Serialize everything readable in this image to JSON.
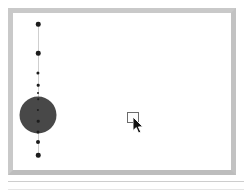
{
  "app": {
    "title": "Drawing Canvas",
    "window_style": "beveled-gray-frame"
  },
  "colors": {
    "frame": "#c9c9c9",
    "frame_shadow": "#bdbdbd",
    "canvas_background": "#ffffff",
    "spine_line": "#cfcfcf",
    "node_fill": "#1c1c1c",
    "blob_fill": "#484848",
    "cursor_outline": "#6b6b6b",
    "footer_rule": "#cecece"
  },
  "canvas": {
    "label": "drawing-canvas",
    "width": 218,
    "height": 157,
    "spine": {
      "label": "vertical-guide-line",
      "x": 25,
      "y_top": 10,
      "y_bottom": 142,
      "color": "#cfcfcf"
    },
    "nodes": [
      {
        "label": "node-1",
        "x": 25,
        "y": 11,
        "size": 4.5
      },
      {
        "label": "node-2",
        "x": 25,
        "y": 40,
        "size": 4.5
      },
      {
        "label": "node-3",
        "x": 25,
        "y": 60,
        "size": 3.2
      },
      {
        "label": "node-4",
        "x": 25,
        "y": 72,
        "size": 2.6
      },
      {
        "label": "node-5",
        "x": 25,
        "y": 80,
        "size": 2.0
      },
      {
        "label": "node-6",
        "x": 25,
        "y": 86,
        "size": 1.6
      },
      {
        "label": "node-7",
        "x": 25,
        "y": 97,
        "size": 2.2
      },
      {
        "label": "node-8",
        "x": 25,
        "y": 108,
        "size": 2.6
      },
      {
        "label": "node-9",
        "x": 25,
        "y": 119,
        "size": 3.0
      },
      {
        "label": "node-10",
        "x": 25,
        "y": 129,
        "size": 4.0
      },
      {
        "label": "node-11",
        "x": 25,
        "y": 142,
        "size": 4.5
      }
    ],
    "blob": {
      "label": "large-filled-circle",
      "x": 25,
      "y": 102,
      "diameter": 37,
      "fill": "#484848"
    },
    "cursor": {
      "label": "mouse-pointer-with-marquee",
      "x": 114,
      "y": 99,
      "marquee_width": 12,
      "marquee_height": 11
    }
  },
  "footer": {
    "rules": 2
  }
}
